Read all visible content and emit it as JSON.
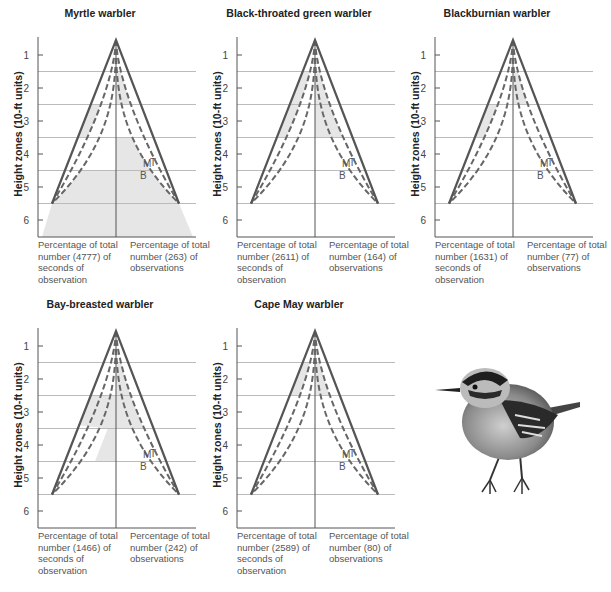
{
  "chart_data": [
    {
      "type": "line",
      "title": "Myrtle warbler",
      "ylabel": "Height zones (10-ft units)",
      "yticks": [
        "1",
        "2",
        "3",
        "4",
        "5",
        "6"
      ],
      "curve_labels": [
        "B",
        "M",
        "T"
      ],
      "left_caption": "Percentage of total number (4777) of seconds of observation",
      "right_caption": "Percentage of total number (263) of observations",
      "seconds_total": 4777,
      "observations_total": 263,
      "shaded_zones_left": [
        [
          2.5,
          3.5
        ],
        [
          4.5,
          6.5
        ]
      ],
      "shaded_zones_right": [
        [
          1.5,
          2.5
        ],
        [
          3.5,
          6.5
        ]
      ]
    },
    {
      "type": "line",
      "title": "Black-throated green warbler",
      "ylabel": "Height zones (10-ft units)",
      "yticks": [
        "1",
        "2",
        "3",
        "4",
        "5",
        "6"
      ],
      "curve_labels": [
        "B",
        "M",
        "T"
      ],
      "left_caption": "Percentage of total number (2611) of seconds of observation",
      "right_caption": "Percentage of total number (164) of observations",
      "seconds_total": 2611,
      "observations_total": 164,
      "shaded_zones_left": [
        [
          1.5,
          3.5
        ]
      ],
      "shaded_zones_right": [
        [
          1.5,
          3.5
        ]
      ]
    },
    {
      "type": "line",
      "title": "Blackburnian warbler",
      "ylabel": "Height zones (10-ft units)",
      "yticks": [
        "1",
        "2",
        "3",
        "4",
        "5",
        "6"
      ],
      "curve_labels": [
        "B",
        "M",
        "T"
      ],
      "left_caption": "Percentage of total number (1631) of seconds of observation",
      "right_caption": "Percentage of total number (77) of observations",
      "seconds_total": 1631,
      "observations_total": 77,
      "shaded_zones_left": [
        [
          2.5,
          3.5
        ]
      ],
      "shaded_zones_right": [
        [
          1.5,
          2.5
        ]
      ]
    },
    {
      "type": "line",
      "title": "Bay-breasted warbler",
      "ylabel": "Height zones (10-ft units)",
      "yticks": [
        "1",
        "2",
        "3",
        "4",
        "5",
        "6"
      ],
      "curve_labels": [
        "B",
        "M",
        "T"
      ],
      "left_caption": "Percentage of total number (1466) of seconds of observation",
      "right_caption": "Percentage of total number (242) of observations",
      "seconds_total": 1466,
      "observations_total": 242,
      "shaded_zones_left": [
        [
          2.5,
          4.5
        ]
      ],
      "shaded_zones_right": [
        [
          1.5,
          3.5
        ]
      ]
    },
    {
      "type": "line",
      "title": "Cape May warbler",
      "ylabel": "Height zones (10-ft units)",
      "yticks": [
        "1",
        "2",
        "3",
        "4",
        "5",
        "6"
      ],
      "curve_labels": [
        "B",
        "M",
        "T"
      ],
      "left_caption": "Percentage of total number (2589) of seconds of observation",
      "right_caption": "Percentage of total number (80) of observations",
      "seconds_total": 2589,
      "observations_total": 80,
      "shaded_zones_left": [
        [
          1.5,
          2.5
        ]
      ],
      "shaded_zones_right": [
        [
          1.5,
          2.5
        ]
      ]
    }
  ],
  "illustration": {
    "subject": "warbler-bird-illustration"
  },
  "colors": {
    "line": "#555555",
    "dash": "#666666",
    "grid": "#bbbbbb",
    "shade": "#e6e6e6",
    "text": "#222222"
  }
}
